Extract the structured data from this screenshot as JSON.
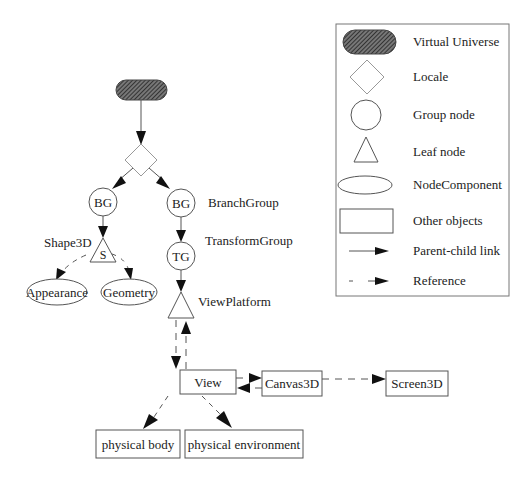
{
  "diagram": {
    "nodes": {
      "virtual_universe": {
        "label": ""
      },
      "locale": {
        "label": ""
      },
      "bg_left": {
        "label": "BG"
      },
      "bg_right": {
        "label": "BG"
      },
      "branchgroup_caption": {
        "label": "BranchGroup"
      },
      "shape3d": {
        "label": "S",
        "caption": "Shape3D"
      },
      "appearance": {
        "label": "Appearance"
      },
      "geometry": {
        "label": "Geometry"
      },
      "tg": {
        "label": "TG"
      },
      "transformgroup_caption": {
        "label": "TransformGroup"
      },
      "viewplatform": {
        "label": "",
        "caption": "ViewPlatform"
      },
      "view": {
        "label": "View"
      },
      "canvas3d": {
        "label": "Canvas3D"
      },
      "screen3d": {
        "label": "Screen3D"
      },
      "physical_body": {
        "label": "physical body"
      },
      "physical_environment": {
        "label": "physical environment"
      }
    },
    "edges": [
      {
        "from": "virtual_universe",
        "to": "locale",
        "type": "parent-child"
      },
      {
        "from": "locale",
        "to": "bg_left",
        "type": "parent-child"
      },
      {
        "from": "locale",
        "to": "bg_right",
        "type": "parent-child"
      },
      {
        "from": "bg_left",
        "to": "shape3d",
        "type": "parent-child"
      },
      {
        "from": "shape3d",
        "to": "appearance",
        "type": "reference"
      },
      {
        "from": "shape3d",
        "to": "geometry",
        "type": "reference"
      },
      {
        "from": "bg_right",
        "to": "tg",
        "type": "parent-child"
      },
      {
        "from": "tg",
        "to": "viewplatform",
        "type": "parent-child"
      },
      {
        "from": "viewplatform",
        "to": "view",
        "type": "reference"
      },
      {
        "from": "view",
        "to": "viewplatform",
        "type": "reference"
      },
      {
        "from": "view",
        "to": "canvas3d",
        "type": "reference"
      },
      {
        "from": "canvas3d",
        "to": "view",
        "type": "reference"
      },
      {
        "from": "canvas3d",
        "to": "screen3d",
        "type": "reference"
      },
      {
        "from": "view",
        "to": "physical_body",
        "type": "reference"
      },
      {
        "from": "view",
        "to": "physical_environment",
        "type": "reference"
      }
    ]
  },
  "legend": {
    "items": [
      {
        "symbol": "virtual-universe-shape",
        "label": "Virtual Universe"
      },
      {
        "symbol": "locale-diamond",
        "label": "Locale"
      },
      {
        "symbol": "group-node-circle",
        "label": "Group node"
      },
      {
        "symbol": "leaf-node-triangle",
        "label": "Leaf node"
      },
      {
        "symbol": "nodecomponent-ellipse",
        "label": "NodeComponent"
      },
      {
        "symbol": "other-objects-rectangle",
        "label": "Other objects"
      },
      {
        "symbol": "solid-arrow",
        "label": "Parent-child link"
      },
      {
        "symbol": "dashed-arrow",
        "label": "Reference"
      }
    ]
  },
  "colors": {
    "stroke": "#555555",
    "arrow": "#111111",
    "hatch": "#333333",
    "background": "#ffffff"
  }
}
